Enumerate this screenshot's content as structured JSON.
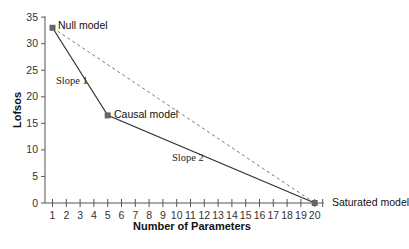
{
  "chart_data": {
    "type": "line",
    "title": "",
    "xlabel": "Number of Parameters",
    "ylabel": "Lofsos",
    "xlim": [
      1,
      20
    ],
    "ylim": [
      0,
      35
    ],
    "x_ticks": [
      1,
      2,
      3,
      4,
      5,
      6,
      7,
      8,
      9,
      10,
      11,
      12,
      13,
      14,
      15,
      16,
      17,
      18,
      19,
      20
    ],
    "y_ticks": [
      0,
      5,
      10,
      15,
      20,
      25,
      30,
      35
    ],
    "grid": false,
    "series": [
      {
        "name": "Model path",
        "style": "solid",
        "color": "#333333",
        "points": [
          {
            "x": 1,
            "y": 33,
            "label": "Null model"
          },
          {
            "x": 5,
            "y": 16.5,
            "label": "Causal model"
          },
          {
            "x": 20,
            "y": 0,
            "label": "Saturated model"
          }
        ]
      },
      {
        "name": "Direct path",
        "style": "dashed",
        "color": "#777777",
        "points": [
          {
            "x": 1,
            "y": 33
          },
          {
            "x": 20,
            "y": 0
          }
        ]
      }
    ],
    "annotations": [
      {
        "text": "Slope 1",
        "x": 2.3,
        "y": 23
      },
      {
        "text": "Slope 2",
        "x": 10,
        "y": 8
      }
    ]
  },
  "labels": {
    "null_model": "Null model",
    "causal_model": "Causal model",
    "saturated_model": "Saturated model",
    "slope1": "Slope 1",
    "slope2": "Slope 2",
    "xlabel": "Number of Parameters",
    "ylabel": "Lofsos"
  },
  "colors": {
    "axis": "#555555",
    "line": "#333333",
    "dashed": "#777777",
    "marker": "#666666"
  }
}
